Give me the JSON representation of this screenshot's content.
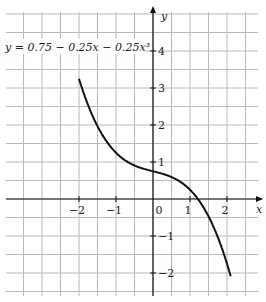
{
  "chart_data": {
    "type": "line",
    "title": "",
    "equation_label": "y = 0.75 − 0.25x − 0.25x³",
    "xlabel": "x",
    "ylabel": "y",
    "x_ticks": [
      "−2",
      "−1",
      "0",
      "1",
      "2"
    ],
    "y_ticks": [
      "4",
      "3",
      "2",
      "1",
      "−1",
      "−2"
    ],
    "xlim": [
      -4,
      2.5
    ],
    "ylim": [
      -2.5,
      5
    ],
    "grid": true,
    "grid_step": 0.5,
    "series": [
      {
        "name": "y = 0.75 − 0.25x − 0.25x³",
        "x_range": [
          -2,
          2.1
        ],
        "coefficients": {
          "c0": 0.75,
          "c1": -0.25,
          "c3": -0.25
        }
      }
    ]
  }
}
